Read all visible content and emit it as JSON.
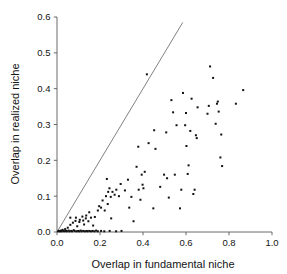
{
  "chart_data": {
    "type": "scatter",
    "title": "",
    "xlabel": "Overlap in fundamental niche",
    "ylabel": "Overlap in realized niche",
    "xlim": [
      0.0,
      1.0
    ],
    "ylim": [
      0.0,
      0.6
    ],
    "xticks": [
      "0.0",
      "0.2",
      "0.4",
      "0.6",
      "0.8",
      "1.0"
    ],
    "xtick_values": [
      0.0,
      0.2,
      0.4,
      0.6,
      0.8,
      1.0
    ],
    "yticks": [
      "0.0",
      "0.1",
      "0.2",
      "0.3",
      "0.4",
      "0.5",
      "0.6"
    ],
    "ytick_values": [
      0.0,
      0.1,
      0.2,
      0.3,
      0.4,
      0.5,
      0.6
    ],
    "grid": false,
    "legend": null,
    "marker": "filled-square",
    "marker_color": "#111111",
    "annotations": [
      {
        "name": "one-to-one-line",
        "type": "line",
        "x": [
          0.0,
          0.585
        ],
        "y": [
          0.0,
          0.585
        ],
        "color": "#6b6b6b"
      }
    ],
    "points": [
      [
        0.005,
        0.002
      ],
      [
        0.01,
        0.003
      ],
      [
        0.014,
        0.002
      ],
      [
        0.018,
        0.004
      ],
      [
        0.022,
        0.002
      ],
      [
        0.026,
        0.006
      ],
      [
        0.03,
        0.003
      ],
      [
        0.034,
        0.002
      ],
      [
        0.038,
        0.008
      ],
      [
        0.042,
        0.003
      ],
      [
        0.046,
        0.002
      ],
      [
        0.05,
        0.012
      ],
      [
        0.054,
        0.004
      ],
      [
        0.058,
        0.002
      ],
      [
        0.062,
        0.02
      ],
      [
        0.066,
        0.003
      ],
      [
        0.07,
        0.002
      ],
      [
        0.074,
        0.026
      ],
      [
        0.078,
        0.005
      ],
      [
        0.082,
        0.003
      ],
      [
        0.086,
        0.031
      ],
      [
        0.09,
        0.002
      ],
      [
        0.094,
        0.016
      ],
      [
        0.098,
        0.003
      ],
      [
        0.102,
        0.002
      ],
      [
        0.106,
        0.034
      ],
      [
        0.11,
        0.004
      ],
      [
        0.114,
        0.002
      ],
      [
        0.118,
        0.043
      ],
      [
        0.122,
        0.003
      ],
      [
        0.126,
        0.021
      ],
      [
        0.13,
        0.002
      ],
      [
        0.134,
        0.038
      ],
      [
        0.138,
        0.003
      ],
      [
        0.142,
        0.002
      ],
      [
        0.15,
        0.003
      ],
      [
        0.158,
        0.002
      ],
      [
        0.166,
        0.003
      ],
      [
        0.174,
        0.002
      ],
      [
        0.182,
        0.004
      ],
      [
        0.19,
        0.002
      ],
      [
        0.205,
        0.003
      ],
      [
        0.22,
        0.002
      ],
      [
        0.245,
        0.003
      ],
      [
        0.275,
        0.002
      ],
      [
        0.3,
        0.003
      ],
      [
        0.062,
        0.04
      ],
      [
        0.088,
        0.04
      ],
      [
        0.104,
        0.028
      ],
      [
        0.122,
        0.032
      ],
      [
        0.136,
        0.046
      ],
      [
        0.146,
        0.03
      ],
      [
        0.158,
        0.04
      ],
      [
        0.15,
        0.055
      ],
      [
        0.176,
        0.042
      ],
      [
        0.168,
        0.018
      ],
      [
        0.19,
        0.06
      ],
      [
        0.196,
        0.072
      ],
      [
        0.205,
        0.068
      ],
      [
        0.212,
        0.088
      ],
      [
        0.222,
        0.06
      ],
      [
        0.228,
        0.1
      ],
      [
        0.236,
        0.078
      ],
      [
        0.238,
        0.112
      ],
      [
        0.244,
        0.122
      ],
      [
        0.25,
        0.098
      ],
      [
        0.258,
        0.112
      ],
      [
        0.252,
        0.038
      ],
      [
        0.268,
        0.104
      ],
      [
        0.276,
        0.118
      ],
      [
        0.288,
        0.1
      ],
      [
        0.296,
        0.134
      ],
      [
        0.232,
        0.148
      ],
      [
        0.316,
        0.116
      ],
      [
        0.33,
        0.146
      ],
      [
        0.336,
        0.068
      ],
      [
        0.346,
        0.098
      ],
      [
        0.356,
        0.03
      ],
      [
        0.37,
        0.182
      ],
      [
        0.378,
        0.238
      ],
      [
        0.38,
        0.118
      ],
      [
        0.388,
        0.09
      ],
      [
        0.394,
        0.16
      ],
      [
        0.398,
        0.132
      ],
      [
        0.402,
        0.122
      ],
      [
        0.408,
        0.168
      ],
      [
        0.418,
        0.44
      ],
      [
        0.426,
        0.248
      ],
      [
        0.448,
        0.066
      ],
      [
        0.452,
        0.284
      ],
      [
        0.458,
        0.232
      ],
      [
        0.48,
        0.126
      ],
      [
        0.498,
        0.16
      ],
      [
        0.508,
        0.278
      ],
      [
        0.512,
        0.15
      ],
      [
        0.52,
        0.096
      ],
      [
        0.532,
        0.368
      ],
      [
        0.54,
        0.334
      ],
      [
        0.548,
        0.16
      ],
      [
        0.556,
        0.298
      ],
      [
        0.572,
        0.066
      ],
      [
        0.578,
        0.118
      ],
      [
        0.586,
        0.388
      ],
      [
        0.596,
        0.298
      ],
      [
        0.6,
        0.332
      ],
      [
        0.602,
        0.24
      ],
      [
        0.608,
        0.162
      ],
      [
        0.612,
        0.186
      ],
      [
        0.62,
        0.282
      ],
      [
        0.626,
        0.372
      ],
      [
        0.634,
        0.106
      ],
      [
        0.64,
        0.118
      ],
      [
        0.646,
        0.27
      ],
      [
        0.65,
        0.262
      ],
      [
        0.654,
        0.348
      ],
      [
        0.7,
        0.33
      ],
      [
        0.706,
        0.352
      ],
      [
        0.712,
        0.462
      ],
      [
        0.726,
        0.43
      ],
      [
        0.738,
        0.302
      ],
      [
        0.744,
        0.358
      ],
      [
        0.748,
        0.364
      ],
      [
        0.752,
        0.336
      ],
      [
        0.76,
        0.208
      ],
      [
        0.764,
        0.272
      ],
      [
        0.768,
        0.184
      ],
      [
        0.832,
        0.358
      ],
      [
        0.866,
        0.396
      ]
    ]
  }
}
